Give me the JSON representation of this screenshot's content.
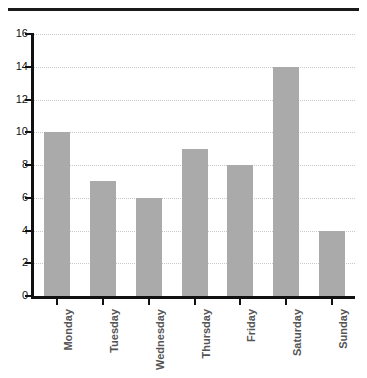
{
  "chart_data": {
    "type": "bar",
    "title": "",
    "xlabel": "",
    "ylabel": "",
    "categories": [
      "Monday",
      "Tuesday",
      "Wednesday",
      "Thursday",
      "Friday",
      "Saturday",
      "Sunday"
    ],
    "values": [
      10,
      7,
      6,
      9,
      8,
      14,
      4
    ],
    "ylim": [
      0,
      16
    ],
    "yticks": [
      0,
      2,
      4,
      6,
      8,
      10,
      12,
      14,
      16
    ],
    "ytick_labels": [
      "0",
      "2",
      "4",
      "6",
      "8",
      "10",
      "12",
      "14",
      "16"
    ],
    "grid": true,
    "grid_axis": "y",
    "grid_style": "dotted",
    "legend": false,
    "bar_color": "#aaaaaa",
    "axis_color": "#111111",
    "grid_color": "#c9c9c9",
    "label_color": "#555555"
  },
  "decor": {
    "top_rule_color": "#1a1a1a"
  }
}
